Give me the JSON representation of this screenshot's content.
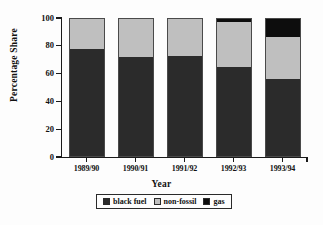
{
  "chart_data": {
    "type": "bar",
    "subtype": "stacked-bar-100",
    "title": "",
    "xlabel": "Year",
    "ylabel": "Percentage Share",
    "categories": [
      "1989/90",
      "1990/91",
      "1991/92",
      "1992/93",
      "1993/94"
    ],
    "series": [
      {
        "name": "black fuel",
        "color": "#2b2b2b",
        "values": [
          78,
          72,
          73,
          65,
          56
        ]
      },
      {
        "name": "non-fossil",
        "color": "#bfbfbf",
        "values": [
          22,
          28,
          27,
          33,
          31
        ]
      },
      {
        "name": "gas",
        "color": "#0d0d0d",
        "values": [
          0,
          0,
          0,
          2,
          13
        ]
      }
    ],
    "ylim": [
      0,
      100
    ],
    "yticks": [
      0,
      20,
      40,
      60,
      80,
      100
    ],
    "ytick_labels": [
      "0",
      "20",
      "40",
      "60",
      "80",
      "100"
    ],
    "grid": false,
    "legend_position": "bottom",
    "legend_entries": [
      "black fuel",
      "non-fossil",
      "gas"
    ]
  },
  "axes": {
    "y_title": "Percentage Share",
    "x_title": "Year"
  },
  "legend": {
    "items": [
      {
        "label": "black fuel",
        "swatch": "legend-swatch-black-fuel"
      },
      {
        "label": "non-fossil",
        "swatch": "legend-swatch-non-fossil"
      },
      {
        "label": "gas",
        "swatch": "legend-swatch-gas"
      }
    ]
  }
}
